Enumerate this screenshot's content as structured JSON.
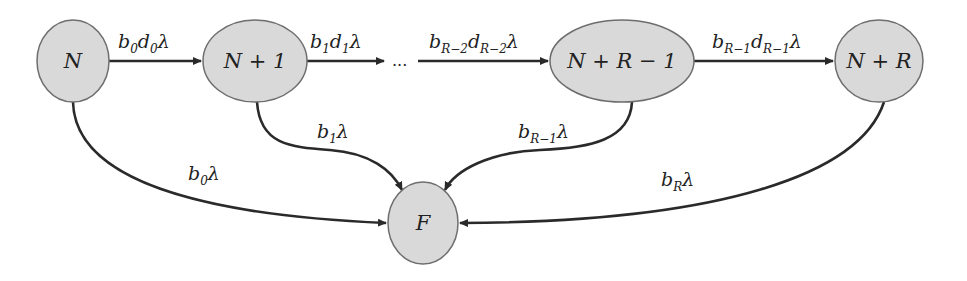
{
  "diagram": {
    "type": "state-transition",
    "nodes": [
      {
        "id": "N",
        "label": "N",
        "cx": 73,
        "cy": 61,
        "rx": 36,
        "ry": 41
      },
      {
        "id": "N+1",
        "label": "N + 1",
        "cx": 255,
        "cy": 61,
        "rx": 52,
        "ry": 41
      },
      {
        "id": "N+R-1",
        "label": "N + R − 1",
        "cx": 622,
        "cy": 61,
        "rx": 72,
        "ry": 41
      },
      {
        "id": "N+R",
        "label": "N + R",
        "cx": 879,
        "cy": 61,
        "rx": 44,
        "ry": 41
      },
      {
        "id": "F",
        "label": "F",
        "cx": 423,
        "cy": 223,
        "rx": 35,
        "ry": 41
      }
    ],
    "ellipsis": "...",
    "edges": [
      {
        "from": "N",
        "to": "N+1",
        "label": {
          "b": "b",
          "b_sub": "0",
          "d": "d",
          "d_sub": "0",
          "rate": "λ"
        }
      },
      {
        "from": "N+1",
        "to": "...",
        "label": {
          "b": "b",
          "b_sub": "1",
          "d": "d",
          "d_sub": "1",
          "rate": "λ"
        }
      },
      {
        "from": "...",
        "to": "N+R-1",
        "label": {
          "b": "b",
          "b_sub": "R−2",
          "d": "d",
          "d_sub": "R−2",
          "rate": "λ"
        }
      },
      {
        "from": "N+R-1",
        "to": "N+R",
        "label": {
          "b": "b",
          "b_sub": "R−1",
          "d": "d",
          "d_sub": "R−1",
          "rate": "λ"
        }
      },
      {
        "from": "N",
        "to": "F",
        "label": {
          "b": "b",
          "b_sub": "0",
          "rate": "λ"
        }
      },
      {
        "from": "N+1",
        "to": "F",
        "label": {
          "b": "b",
          "b_sub": "1",
          "rate": "λ"
        }
      },
      {
        "from": "N+R-1",
        "to": "F",
        "label": {
          "b": "b",
          "b_sub": "R−1",
          "rate": "λ"
        }
      },
      {
        "from": "N+R",
        "to": "F",
        "label": {
          "b": "b",
          "b_sub": "R",
          "rate": "λ"
        }
      }
    ],
    "colors": {
      "node_fill": "#d9d9d9",
      "node_stroke": "#6e6e6e",
      "edge": "#2a2a2a",
      "text": "#222222"
    }
  }
}
